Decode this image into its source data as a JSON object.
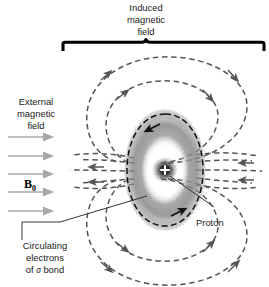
{
  "figure": {
    "background_color": "#ffffff"
  },
  "labels": {
    "induced_field": {
      "line1": "Induced",
      "line2": "magnetic",
      "line3": "field"
    },
    "external_field": {
      "line1": "External",
      "line2": "magnetic",
      "line3": "field"
    },
    "b0_symbol": "B",
    "b0_subscript": "0",
    "proton": "Proton",
    "circulating": {
      "line1": "Circulating",
      "line2": "electrons",
      "line3_prefix": "of ",
      "line3_sigma": "σ",
      "line3_suffix": " bond"
    }
  },
  "colors": {
    "field_line": "#555555",
    "external_arrow": "#a8a8a8",
    "bracket": "#000000",
    "electron_orbit": "#111111",
    "leader_line": "#333333",
    "text": "#1a1a1a",
    "electron_cloud": "#8c8c8c"
  },
  "elements": {
    "external_arrows_count": 5,
    "induced_loops_count": 4,
    "radial_lines_left": 5,
    "radial_lines_right": 5,
    "proton_glyph": "+"
  }
}
